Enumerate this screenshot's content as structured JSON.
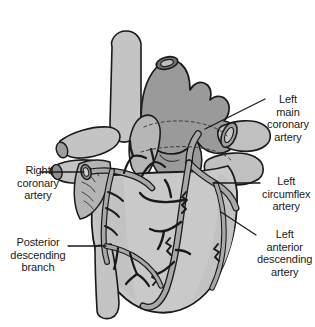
{
  "figure": {
    "background_color": "#ffffff",
    "ink_color": "#1a1a1a",
    "fills": {
      "ventricle": "#c9c9c9",
      "aorta": "#9a9a9a",
      "pulmonary_artery": "#bdbdbd",
      "atrium": "#b0b0b0",
      "vessel_tube": "#a8a8a8",
      "vessel_highlight": "#d8d8d8",
      "fat_pad": "#b8b8b8"
    }
  },
  "labels": {
    "left_main": {
      "name": "left-main-coronary-artery",
      "lines": [
        "Left",
        "main",
        "coronary",
        "artery"
      ],
      "side": "right"
    },
    "left_circumflex": {
      "name": "left-circumflex-artery",
      "lines": [
        "Left",
        "circumflex",
        "artery"
      ],
      "side": "right"
    },
    "left_anterior_descending": {
      "name": "left-anterior-descending-artery",
      "lines": [
        "Left",
        "anterior",
        "descending",
        "artery"
      ],
      "side": "right"
    },
    "right_coronary": {
      "name": "right-coronary-artery",
      "lines": [
        "Right",
        "coronary",
        "artery"
      ],
      "side": "left"
    },
    "posterior_descending": {
      "name": "posterior-descending-branch",
      "lines": [
        "Posterior",
        "descending",
        "branch"
      ],
      "side": "left"
    }
  },
  "leader_lines": [
    {
      "name": "leader-left-main",
      "from": [
        265,
        99
      ],
      "to": [
        205,
        129
      ]
    },
    {
      "name": "leader-left-circumflex",
      "from": [
        260,
        183
      ],
      "to": [
        213,
        183
      ]
    },
    {
      "name": "leader-left-anterior-desc",
      "from": [
        256,
        235
      ],
      "to": [
        222,
        213
      ]
    },
    {
      "name": "leader-right-coronary",
      "from": [
        40,
        172
      ],
      "to": [
        88,
        172
      ]
    },
    {
      "name": "leader-posterior-descending",
      "from": [
        68,
        246
      ],
      "to": [
        106,
        246
      ]
    }
  ],
  "anatomy": [
    {
      "name": "aorta",
      "label": "Aorta"
    },
    {
      "name": "pulmonary-artery",
      "label": "Pulmonary artery"
    },
    {
      "name": "superior-vena-cava",
      "label": "Superior vena cava"
    },
    {
      "name": "left-atrium",
      "label": "Left atrium"
    },
    {
      "name": "right-atrium",
      "label": "Right atrium"
    },
    {
      "name": "left-ventricle",
      "label": "Left ventricle"
    },
    {
      "name": "right-ventricle",
      "label": "Right ventricle"
    }
  ]
}
